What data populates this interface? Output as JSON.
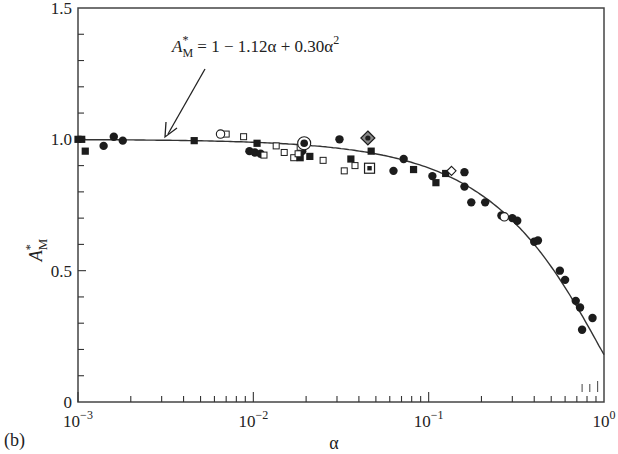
{
  "panel_label": "(b)",
  "chart_data": {
    "type": "scatter",
    "title": "",
    "xlabel": "α",
    "ylabel": "A*_M",
    "xscale": "log",
    "xlim": [
      0.001,
      1
    ],
    "ylim": [
      0,
      1.5
    ],
    "grid": false,
    "x_ticks": [
      {
        "value": 0.001,
        "label_base": "10",
        "label_exp": "−3"
      },
      {
        "value": 0.01,
        "label_base": "10",
        "label_exp": "−2"
      },
      {
        "value": 0.1,
        "label_base": "10",
        "label_exp": "−1"
      },
      {
        "value": 1,
        "label_base": "10",
        "label_exp": "0"
      }
    ],
    "y_ticks": [
      {
        "value": 0,
        "label": "0"
      },
      {
        "value": 0.5,
        "label": "0.5"
      },
      {
        "value": 1.0,
        "label": "1.0"
      },
      {
        "value": 1.5,
        "label": "1.5"
      }
    ],
    "annotation": {
      "text_lhs": "A",
      "text_sup": "*",
      "text_sub": "M",
      "text_rhs": " = 1 − 1.12α + 0.30α",
      "text_rhs_sup": "2",
      "arrow_to": {
        "x": 0.003,
        "y": 1.0
      }
    },
    "fit_curve": {
      "name": "A*_M = 1 − 1.12α + 0.30α²",
      "a0": 1,
      "a1": -1.12,
      "a2": 0.3
    },
    "series": [
      {
        "name": "filled circles",
        "marker": "circle-filled",
        "points": [
          [
            0.0014,
            0.975
          ],
          [
            0.0016,
            1.01
          ],
          [
            0.0018,
            0.995
          ],
          [
            0.0095,
            0.955
          ],
          [
            0.0102,
            0.95
          ],
          [
            0.011,
            0.945
          ],
          [
            0.019,
            0.955
          ],
          [
            0.031,
            1.0
          ],
          [
            0.063,
            0.88
          ],
          [
            0.072,
            0.925
          ],
          [
            0.105,
            0.86
          ],
          [
            0.16,
            0.875
          ],
          [
            0.16,
            0.82
          ],
          [
            0.175,
            0.76
          ],
          [
            0.21,
            0.76
          ],
          [
            0.26,
            0.71
          ],
          [
            0.3,
            0.7
          ],
          [
            0.32,
            0.69
          ],
          [
            0.4,
            0.61
          ],
          [
            0.42,
            0.615
          ],
          [
            0.56,
            0.5
          ],
          [
            0.6,
            0.465
          ],
          [
            0.69,
            0.385
          ],
          [
            0.73,
            0.36
          ],
          [
            0.75,
            0.275
          ],
          [
            0.86,
            0.32
          ]
        ]
      },
      {
        "name": "filled squares",
        "marker": "square-filled",
        "points": [
          [
            0.001,
            1.0
          ],
          [
            0.0011,
            0.955
          ],
          [
            0.00105,
            1.0
          ],
          [
            0.0046,
            0.995
          ],
          [
            0.0105,
            0.985
          ],
          [
            0.0185,
            0.93
          ],
          [
            0.021,
            0.935
          ],
          [
            0.036,
            0.925
          ],
          [
            0.047,
            0.955
          ],
          [
            0.082,
            0.885
          ],
          [
            0.11,
            0.835
          ],
          [
            0.125,
            0.87
          ]
        ]
      },
      {
        "name": "open squares",
        "marker": "square-open",
        "points": [
          [
            0.007,
            1.02
          ],
          [
            0.0088,
            1.01
          ],
          [
            0.0115,
            0.94
          ],
          [
            0.0135,
            0.975
          ],
          [
            0.015,
            0.95
          ],
          [
            0.017,
            0.93
          ],
          [
            0.018,
            0.945
          ],
          [
            0.0185,
            0.97
          ],
          [
            0.025,
            0.92
          ],
          [
            0.033,
            0.88
          ],
          [
            0.038,
            0.9
          ]
        ]
      },
      {
        "name": "open circles",
        "marker": "circle-open",
        "points": [
          [
            0.0065,
            1.02
          ],
          [
            0.27,
            0.705
          ]
        ]
      },
      {
        "name": "circle with dot",
        "marker": "circle-dot",
        "points": [
          [
            0.0195,
            0.985
          ]
        ]
      },
      {
        "name": "diamond with dot",
        "marker": "diamond-dot",
        "points": [
          [
            0.045,
            1.005
          ]
        ]
      },
      {
        "name": "square with dot",
        "marker": "square-dot",
        "points": [
          [
            0.046,
            0.89
          ]
        ]
      },
      {
        "name": "open diamond",
        "marker": "diamond-open",
        "points": [
          [
            0.135,
            0.88
          ]
        ]
      }
    ],
    "lower_right_marks": [
      0.75,
      0.83,
      0.92
    ]
  }
}
